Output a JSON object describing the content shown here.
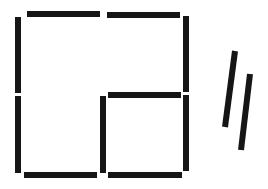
{
  "diagram": {
    "type": "matchstick-puzzle",
    "title": "Matchstick squares puzzle",
    "background": "#ffffff",
    "match_color": "#161616",
    "match_thickness": 6,
    "structure_description": "Square grid outline of 10 matches: a 2x2 arrangement with top-left, top-right, bottom-right small squares partially formed; inner match cross forms a small lower-right square. Two loose diagonal matches to the right.",
    "matches": [
      {
        "id": "top-left-h",
        "orientation": "horizontal",
        "x": 27,
        "y": 11,
        "w": 73,
        "h": 6
      },
      {
        "id": "top-right-h",
        "orientation": "horizontal",
        "x": 107,
        "y": 12,
        "w": 73,
        "h": 6
      },
      {
        "id": "left-upper-v",
        "orientation": "vertical",
        "x": 15,
        "y": 17,
        "w": 6,
        "h": 76
      },
      {
        "id": "right-upper-v",
        "orientation": "vertical",
        "x": 183,
        "y": 16,
        "w": 6,
        "h": 76
      },
      {
        "id": "middle-h",
        "orientation": "horizontal",
        "x": 108,
        "y": 92,
        "w": 73,
        "h": 6
      },
      {
        "id": "left-lower-v",
        "orientation": "vertical",
        "x": 15,
        "y": 96,
        "w": 6,
        "h": 77
      },
      {
        "id": "inner-v",
        "orientation": "vertical",
        "x": 100,
        "y": 96,
        "w": 6,
        "h": 77
      },
      {
        "id": "right-lower-v",
        "orientation": "vertical",
        "x": 183,
        "y": 95,
        "w": 6,
        "h": 76
      },
      {
        "id": "bottom-left-h",
        "orientation": "horizontal",
        "x": 24,
        "y": 172,
        "w": 73,
        "h": 6
      },
      {
        "id": "bottom-right-h",
        "orientation": "horizontal",
        "x": 108,
        "y": 172,
        "w": 74,
        "h": 6
      }
    ],
    "loose_matches": [
      {
        "id": "loose-1",
        "x1": 235,
        "y1": 51,
        "x2": 225,
        "y2": 127
      },
      {
        "id": "loose-2",
        "x1": 250,
        "y1": 74,
        "x2": 241,
        "y2": 150
      }
    ],
    "counts": {
      "placed": 10,
      "loose": 2,
      "total": 12
    }
  }
}
